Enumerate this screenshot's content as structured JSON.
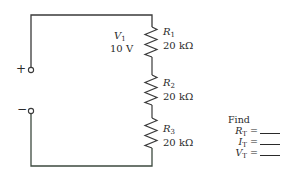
{
  "diagram": {
    "type": "series-resistor-circuit",
    "source": {
      "symbol": "V",
      "subscript": "1",
      "value": "10 V"
    },
    "terminals": {
      "positive": "+",
      "negative": "−"
    },
    "resistors": [
      {
        "symbol": "R",
        "subscript": "1",
        "value": "20 kΩ"
      },
      {
        "symbol": "R",
        "subscript": "2",
        "value": "20 kΩ"
      },
      {
        "symbol": "R",
        "subscript": "3",
        "value": "20 kΩ"
      }
    ],
    "find": {
      "title": "Find",
      "items": [
        {
          "symbol": "R",
          "subscript": "T",
          "suffix": " ="
        },
        {
          "symbol": "I",
          "subscript": "T",
          "suffix": " ="
        },
        {
          "symbol": "V",
          "subscript": "T",
          "suffix": " ="
        }
      ]
    },
    "colors": {
      "wire": "#3a3a3a",
      "bottom_wire": "#3d4a3f",
      "background": "#ffffff"
    }
  }
}
